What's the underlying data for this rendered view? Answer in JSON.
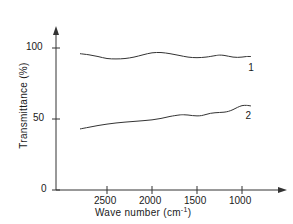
{
  "chart_data": {
    "type": "line",
    "title": "",
    "xlabel": "Wave number (cm",
    "xlabel_superscript": "-1",
    "xlabel_suffix": ")",
    "ylabel": "Transmittance (%)",
    "xlim": [
      2800,
      850
    ],
    "ylim": [
      0,
      108
    ],
    "x_reversed": true,
    "grid": false,
    "legend": "inline-curve-labels",
    "xticks": [
      2500,
      2000,
      1500,
      1000
    ],
    "xtick_labels": [
      "2500",
      "2000",
      "1500",
      "1000"
    ],
    "yticks": [
      0,
      50,
      100
    ],
    "ytick_labels": [
      "0",
      "50",
      "100"
    ],
    "line_color": "#333333",
    "axis_color": "#333333",
    "series": [
      {
        "name": "1",
        "label": "1",
        "label_x": 930,
        "label_y": 86,
        "x": [
          2800,
          2700,
          2600,
          2500,
          2400,
          2300,
          2200,
          2100,
          2000,
          1900,
          1800,
          1700,
          1600,
          1500,
          1400,
          1300,
          1250,
          1200,
          1150,
          1100,
          1050,
          1000,
          950,
          900
        ],
        "values": [
          96.0,
          95.2,
          94.0,
          92.6,
          92.3,
          92.6,
          93.6,
          95.2,
          96.6,
          96.8,
          96.0,
          94.8,
          93.6,
          93.2,
          93.6,
          94.6,
          95.0,
          94.8,
          94.2,
          93.6,
          93.4,
          93.6,
          94.0,
          94.0
        ]
      },
      {
        "name": "2",
        "label": "2",
        "label_x": 960,
        "label_y": 52,
        "x": [
          2800,
          2700,
          2600,
          2500,
          2400,
          2300,
          2200,
          2100,
          2000,
          1900,
          1800,
          1700,
          1650,
          1600,
          1550,
          1500,
          1450,
          1400,
          1350,
          1300,
          1250,
          1200,
          1150,
          1100,
          1050,
          1000,
          950,
          900
        ],
        "values": [
          43.0,
          44.2,
          45.4,
          46.4,
          47.2,
          47.8,
          48.3,
          48.8,
          49.4,
          50.4,
          51.8,
          52.8,
          53.0,
          52.8,
          52.4,
          52.2,
          52.4,
          53.2,
          54.0,
          54.4,
          54.6,
          54.8,
          55.4,
          56.6,
          58.2,
          59.4,
          59.6,
          59.2
        ]
      }
    ]
  },
  "axes": {
    "x_arrow": true,
    "y_arrow": true
  }
}
